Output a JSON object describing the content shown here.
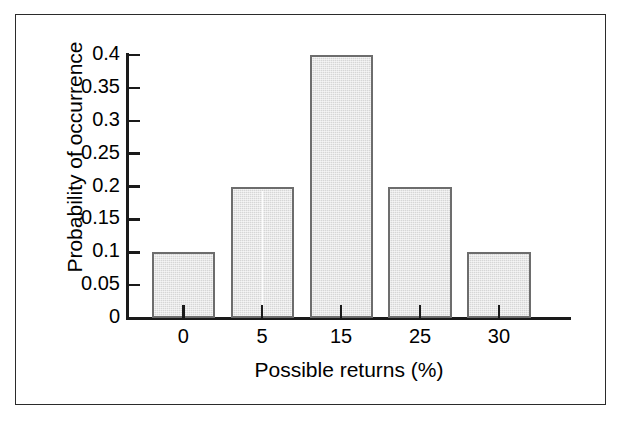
{
  "chart_data": {
    "type": "bar",
    "title": "",
    "subtitle": "",
    "xlabel": "Possible returns (%)",
    "ylabel": "Probability of occurrence",
    "categories": [
      "0",
      "5",
      "15",
      "25",
      "30"
    ],
    "values": [
      0.1,
      0.2,
      0.4,
      0.2,
      0.1
    ],
    "series": [
      {
        "name": "Probability of occurrence",
        "values": [
          0.1,
          0.2,
          0.4,
          0.2,
          0.1
        ]
      }
    ],
    "ylim": [
      0,
      0.4
    ],
    "ytick_labels": [
      "0",
      "0.05",
      "0.1",
      "0.15",
      "0.2",
      "0.25",
      "0.3",
      "0.35",
      "0.4"
    ],
    "ytick_values": [
      0,
      0.05,
      0.1,
      0.15,
      0.2,
      0.25,
      0.3,
      0.35,
      0.4
    ],
    "xtick_labels": [
      "0",
      "5",
      "15",
      "25",
      "30"
    ],
    "grid": false,
    "legend": false,
    "legend_position": "none",
    "annotations": []
  },
  "style": {
    "bar_fill": "#d6d6d6",
    "bar_border": "#6d6d6d",
    "axis_color": "#1a1a1a",
    "frame_color": "#2b2b2b",
    "background": "#ffffff",
    "text_color": "#000000"
  }
}
